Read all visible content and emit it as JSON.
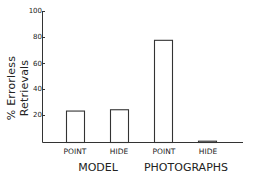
{
  "chart_data": {
    "type": "bar",
    "title": "",
    "xlabel": "",
    "ylabel": "% Errorless Retrievals",
    "ylim": [
      0,
      100
    ],
    "yticks": [
      20,
      40,
      60,
      80,
      100
    ],
    "grid": false,
    "legend": null,
    "groups": [
      "MODEL",
      "PHOTOGRAPHS"
    ],
    "categories": [
      "POINT",
      "HIDE",
      "POINT",
      "HIDE"
    ],
    "category_groups": [
      "MODEL",
      "MODEL",
      "PHOTOGRAPHS",
      "PHOTOGRAPHS"
    ],
    "values": [
      24,
      25,
      78,
      1
    ],
    "bar_style": "outline"
  },
  "axis": {
    "ylabel": "% Errorless Retrievals",
    "yticks": [
      "20",
      "40",
      "60",
      "80",
      "100"
    ]
  },
  "labels": {
    "bars": [
      "POINT",
      "HIDE",
      "POINT",
      "HIDE"
    ],
    "groups": [
      "MODEL",
      "PHOTOGRAPHS"
    ]
  }
}
